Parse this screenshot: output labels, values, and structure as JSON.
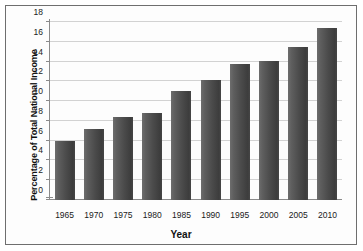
{
  "chart_data": {
    "type": "bar",
    "title": "",
    "xlabel": "Year",
    "ylabel": "Percentage of Total National Income",
    "categories": [
      "1965",
      "1970",
      "1975",
      "1980",
      "1985",
      "1990",
      "1995",
      "2000",
      "2005",
      "2010"
    ],
    "values": [
      6.0,
      7.2,
      8.4,
      8.8,
      11.0,
      12.1,
      13.8,
      14.1,
      15.5,
      17.4
    ],
    "ylim": [
      0,
      18
    ],
    "yticks": [
      "0",
      "2",
      "4",
      "6",
      "8",
      "10",
      "12",
      "14",
      "16",
      "18"
    ],
    "ytick_values": [
      0,
      2,
      4,
      6,
      8,
      10,
      12,
      14,
      16,
      18
    ],
    "grid": true,
    "legend": "none",
    "bar_color": "#4b4b4b",
    "grid_color": "#d2d2d2",
    "axis_color": "#8a8a8a",
    "frame_color": "#6e6e6e",
    "background": "#ffffff"
  }
}
